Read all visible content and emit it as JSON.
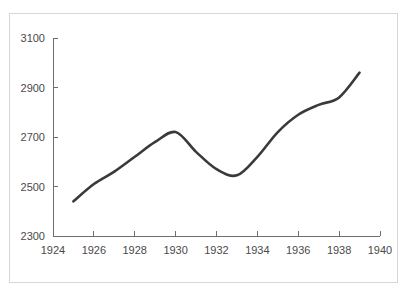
{
  "figure": {
    "background_color": "#ffffff",
    "frame_color": "#d6d6d6",
    "line_color": "#3a3a3a",
    "axis_color": "#6e6e6e",
    "tick_label_color": "#4a4a4a"
  },
  "chart_data": {
    "type": "line",
    "title": "",
    "subtitle": "",
    "xlabel": "",
    "ylabel": "",
    "xlim": [
      1924,
      1940
    ],
    "ylim": [
      2300,
      3100
    ],
    "grid": false,
    "legend": false,
    "legend_position": "none",
    "x_ticks": [
      1924,
      1926,
      1928,
      1930,
      1932,
      1934,
      1936,
      1938,
      1940
    ],
    "x_tick_labels": [
      "1924",
      "1926",
      "1928",
      "1930",
      "1932",
      "1934",
      "1936",
      "1938",
      "1940"
    ],
    "y_ticks": [
      2300,
      2500,
      2700,
      2900,
      3100
    ],
    "y_tick_labels": [
      "2300",
      "2500",
      "2700",
      "2900",
      "3100"
    ],
    "x": [
      1925,
      1926,
      1927,
      1928,
      1929,
      1930,
      1931,
      1932,
      1933,
      1934,
      1935,
      1936,
      1937,
      1938,
      1939
    ],
    "series": [
      {
        "name": "series-1",
        "color": "#3a3a3a",
        "values": [
          2440,
          2510,
          2560,
          2620,
          2680,
          2720,
          2640,
          2570,
          2545,
          2620,
          2720,
          2790,
          2830,
          2860,
          2960
        ]
      }
    ],
    "annotations": []
  }
}
